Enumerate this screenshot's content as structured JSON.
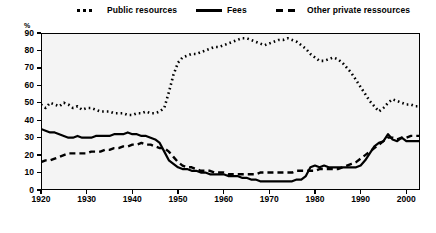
{
  "chart_data": {
    "type": "line",
    "title": "",
    "xlabel": "",
    "ylabel": "%",
    "xlim": [
      1920,
      2003
    ],
    "ylim": [
      0,
      90
    ],
    "yticks": [
      0,
      10,
      20,
      30,
      40,
      50,
      60,
      70,
      80,
      90
    ],
    "xticks": [
      1920,
      1930,
      1940,
      1950,
      1960,
      1970,
      1980,
      1990,
      2000
    ],
    "grid": false,
    "legend_position": "top",
    "series": [
      {
        "name": "Public resources",
        "style": "dotted",
        "color": "#000000",
        "x": [
          1920,
          1921,
          1922,
          1923,
          1924,
          1925,
          1926,
          1927,
          1928,
          1929,
          1930,
          1931,
          1932,
          1933,
          1934,
          1935,
          1936,
          1937,
          1938,
          1939,
          1940,
          1941,
          1942,
          1943,
          1944,
          1945,
          1946,
          1947,
          1948,
          1949,
          1950,
          1951,
          1952,
          1953,
          1954,
          1955,
          1956,
          1957,
          1958,
          1959,
          1960,
          1961,
          1962,
          1963,
          1964,
          1965,
          1966,
          1967,
          1968,
          1969,
          1970,
          1971,
          1972,
          1973,
          1974,
          1975,
          1976,
          1977,
          1978,
          1979,
          1980,
          1981,
          1982,
          1983,
          1984,
          1985,
          1986,
          1987,
          1988,
          1989,
          1990,
          1991,
          1992,
          1993,
          1994,
          1995,
          1996,
          1997,
          1998,
          1999,
          2000,
          2001,
          2002,
          2003
        ],
        "values": [
          49,
          47,
          50,
          49,
          48,
          50,
          49,
          47,
          48,
          46,
          47,
          47,
          46,
          45,
          45,
          45,
          44,
          44,
          44,
          43,
          43,
          44,
          44,
          45,
          44,
          44,
          45,
          47,
          56,
          66,
          73,
          76,
          77,
          78,
          78,
          79,
          80,
          81,
          82,
          82,
          83,
          84,
          85,
          86,
          87,
          87,
          86,
          85,
          84,
          83,
          84,
          85,
          86,
          86,
          87,
          86,
          85,
          83,
          81,
          78,
          76,
          74,
          74,
          75,
          76,
          75,
          73,
          70,
          67,
          63,
          59,
          55,
          51,
          48,
          45,
          47,
          50,
          52,
          51,
          50,
          49,
          49,
          48,
          48
        ]
      },
      {
        "name": "Fees",
        "style": "solid",
        "color": "#000000",
        "x": [
          1920,
          1921,
          1922,
          1923,
          1924,
          1925,
          1926,
          1927,
          1928,
          1929,
          1930,
          1931,
          1932,
          1933,
          1934,
          1935,
          1936,
          1937,
          1938,
          1939,
          1940,
          1941,
          1942,
          1943,
          1944,
          1945,
          1946,
          1947,
          1948,
          1949,
          1950,
          1951,
          1952,
          1953,
          1954,
          1955,
          1956,
          1957,
          1958,
          1959,
          1960,
          1961,
          1962,
          1963,
          1964,
          1965,
          1966,
          1967,
          1968,
          1969,
          1970,
          1971,
          1972,
          1973,
          1974,
          1975,
          1976,
          1977,
          1978,
          1979,
          1980,
          1981,
          1982,
          1983,
          1984,
          1985,
          1986,
          1987,
          1988,
          1989,
          1990,
          1991,
          1992,
          1993,
          1994,
          1995,
          1996,
          1997,
          1998,
          1999,
          2000,
          2001,
          2002,
          2003
        ],
        "values": [
          35,
          34,
          33,
          33,
          32,
          31,
          30,
          30,
          31,
          30,
          30,
          30,
          31,
          31,
          31,
          31,
          32,
          32,
          32,
          33,
          32,
          32,
          31,
          31,
          30,
          29,
          27,
          22,
          17,
          15,
          13,
          12,
          12,
          11,
          11,
          10,
          10,
          9,
          9,
          9,
          9,
          8,
          8,
          8,
          7,
          7,
          6,
          6,
          5,
          5,
          5,
          5,
          5,
          5,
          5,
          5,
          6,
          6,
          8,
          13,
          14,
          13,
          14,
          13,
          13,
          13,
          13,
          13,
          13,
          13,
          14,
          17,
          21,
          25,
          27,
          28,
          32,
          29,
          28,
          30,
          28,
          28,
          28,
          28
        ]
      },
      {
        "name": "Other private ressources",
        "style": "dashed",
        "color": "#000000",
        "x": [
          1920,
          1921,
          1922,
          1923,
          1924,
          1925,
          1926,
          1927,
          1928,
          1929,
          1930,
          1931,
          1932,
          1933,
          1934,
          1935,
          1936,
          1937,
          1938,
          1939,
          1940,
          1941,
          1942,
          1943,
          1944,
          1945,
          1946,
          1947,
          1948,
          1949,
          1950,
          1951,
          1952,
          1953,
          1954,
          1955,
          1956,
          1957,
          1958,
          1959,
          1960,
          1961,
          1962,
          1963,
          1964,
          1965,
          1966,
          1967,
          1968,
          1969,
          1970,
          1971,
          1972,
          1973,
          1974,
          1975,
          1976,
          1977,
          1978,
          1979,
          1980,
          1981,
          1982,
          1983,
          1984,
          1985,
          1986,
          1987,
          1988,
          1989,
          1990,
          1991,
          1992,
          1993,
          1994,
          1995,
          1996,
          1997,
          1998,
          1999,
          2000,
          2001,
          2002,
          2003
        ],
        "values": [
          16,
          17,
          17,
          18,
          19,
          20,
          21,
          21,
          21,
          21,
          21,
          22,
          22,
          22,
          23,
          23,
          24,
          24,
          25,
          25,
          26,
          26,
          27,
          26,
          26,
          25,
          24,
          24,
          22,
          19,
          16,
          14,
          13,
          13,
          12,
          11,
          11,
          11,
          10,
          10,
          10,
          9,
          9,
          9,
          9,
          9,
          9,
          9,
          10,
          10,
          10,
          10,
          10,
          10,
          10,
          10,
          11,
          11,
          11,
          11,
          11,
          12,
          12,
          12,
          12,
          12,
          13,
          14,
          15,
          16,
          18,
          20,
          22,
          24,
          26,
          28,
          30,
          30,
          29,
          30,
          30,
          31,
          31,
          31
        ]
      }
    ]
  },
  "legend": {
    "items": [
      {
        "label": "Public resources",
        "style": "dotted"
      },
      {
        "label": "Fees",
        "style": "solid"
      },
      {
        "label": "Other private ressources",
        "style": "dashed"
      }
    ]
  },
  "axes": {
    "y_unit_label": "%",
    "y_tick_labels": [
      "90",
      "80",
      "70",
      "60",
      "50",
      "40",
      "30",
      "20",
      "10",
      "0"
    ],
    "x_tick_labels": [
      "1920",
      "1930",
      "1940",
      "1950",
      "1960",
      "1970",
      "1980",
      "1990",
      "2000"
    ]
  }
}
